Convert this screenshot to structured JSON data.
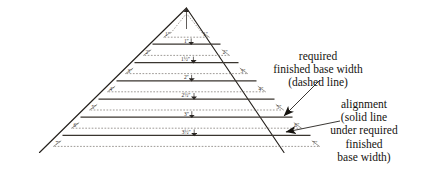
{
  "figure": {
    "title": "",
    "type": "technical-elevation-diagram",
    "colors": {
      "outline": "#24201c",
      "solid_alignment": "#3a352f",
      "dashed_required": "#6b655e",
      "text": "#15130f",
      "background": "#ffffff"
    }
  },
  "apex": {
    "dimension_label": "",
    "has_vertical_arrow": true,
    "has_dashed_triangle": true
  },
  "courses": [
    {
      "index": 1,
      "corner_label_left": "1″",
      "corner_label_right": "1″",
      "center_dimension": "1″"
    },
    {
      "index": 2,
      "corner_label_left": "2″",
      "corner_label_right": "2″",
      "center_dimension": "1½″"
    },
    {
      "index": 3,
      "corner_label_left": "3″",
      "corner_label_right": "3″",
      "center_dimension": "2″"
    },
    {
      "index": 4,
      "corner_label_left": "4″",
      "corner_label_right": "4″",
      "center_dimension": "2½″"
    },
    {
      "index": 5,
      "corner_label_left": "5″",
      "corner_label_right": "5″",
      "center_dimension": "3″"
    },
    {
      "index": 6,
      "corner_label_left": "6″",
      "corner_label_right": "6″",
      "center_dimension": "3½″"
    },
    {
      "index": 7,
      "corner_label_left": "7″",
      "corner_label_right": "7″",
      "center_dimension": ""
    }
  ],
  "annotations": {
    "required": {
      "lines": [
        "required",
        "finished base width",
        "(dashed line)"
      ]
    },
    "alignment": {
      "lines": [
        "alignment",
        "(solid line",
        "under required",
        "finished",
        "base width)"
      ]
    }
  }
}
